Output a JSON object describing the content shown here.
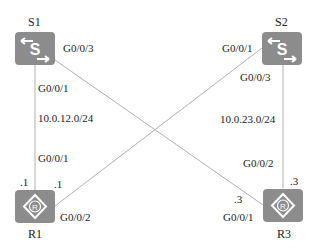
{
  "devices": {
    "S1": {
      "name": "S1",
      "type": "switch",
      "icon": "switch-icon"
    },
    "S2": {
      "name": "S2",
      "type": "switch",
      "icon": "switch-icon"
    },
    "R1": {
      "name": "R1",
      "type": "router",
      "icon": "router-icon"
    },
    "R3": {
      "name": "R3",
      "type": "router",
      "icon": "router-icon"
    }
  },
  "links": [
    {
      "from": "S1",
      "from_if": "G0/0/1",
      "to": "R1",
      "to_if": "G0/0/1",
      "subnet": "10.0.12.0/24",
      "to_addr": ".1"
    },
    {
      "from": "S1",
      "from_if": "G0/0/3",
      "to": "R3",
      "to_if": "G0/0/1",
      "to_addr": ".3"
    },
    {
      "from": "S2",
      "from_if": "G0/0/1",
      "to": "R1",
      "to_if": "G0/0/2",
      "to_addr": ".1"
    },
    {
      "from": "S2",
      "from_if": "G0/0/3",
      "to": "R3",
      "to_if": "G0/0/2",
      "subnet": "10.0.23.0/24",
      "to_addr": ".3"
    }
  ],
  "colors": {
    "device": "#8c8c8c",
    "link": "#b0b0b0",
    "icon_fg": "#ffffff"
  }
}
